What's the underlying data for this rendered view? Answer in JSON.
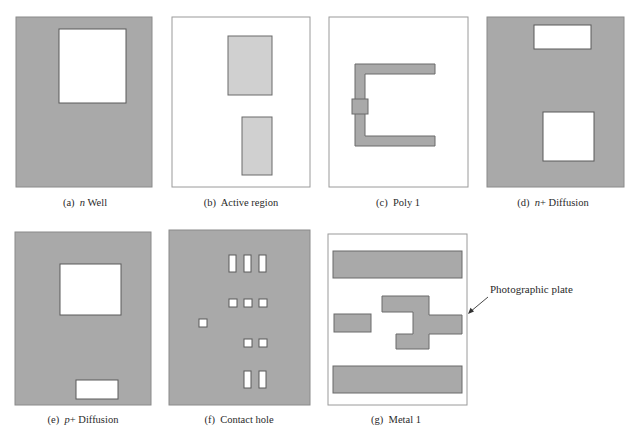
{
  "colors": {
    "dark_fill": "#a9a9a9",
    "light_fill": "#d0d0d0",
    "outline": "#6a6a6a",
    "plate_border": "#9a9a9a",
    "white": "#ffffff"
  },
  "panels": [
    {
      "id": "a",
      "prefix": "(a)",
      "italic": "n",
      "suffix": " Well"
    },
    {
      "id": "b",
      "prefix": "(b)",
      "italic": "",
      "suffix": " Active region"
    },
    {
      "id": "c",
      "prefix": "(c)",
      "italic": "",
      "suffix": " Poly 1"
    },
    {
      "id": "d",
      "prefix": "(d)",
      "italic": "n",
      "suffix": "+ Diffusion"
    },
    {
      "id": "e",
      "prefix": "(e)",
      "italic": "p",
      "suffix": "+ Diffusion"
    },
    {
      "id": "f",
      "prefix": "(f)",
      "italic": "",
      "suffix": " Contact hole"
    },
    {
      "id": "g",
      "prefix": "(g)",
      "italic": "",
      "suffix": " Metal 1"
    }
  ],
  "annotation": {
    "label": "Photographic plate",
    "points_to": "g"
  }
}
